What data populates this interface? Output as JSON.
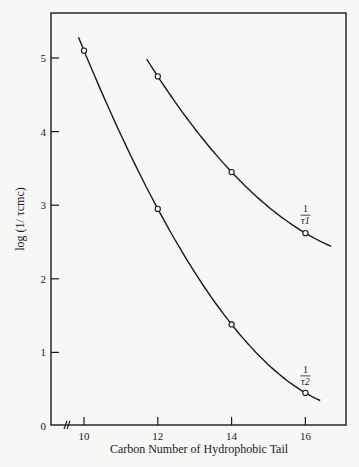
{
  "chart_data": {
    "type": "line",
    "title": "",
    "xlabel": "Carbon Number of Hydrophobic Tail",
    "ylabel": "log (1/ τcmc)",
    "x_ticks": [
      "10",
      "12",
      "14",
      "16"
    ],
    "y_ticks": [
      "0",
      "1",
      "2",
      "3",
      "4",
      "5"
    ],
    "xlim": [
      8.9,
      17
    ],
    "ylim": [
      0,
      5.6
    ],
    "grid": false,
    "axis_break_x": true,
    "series": [
      {
        "name": "1/τ1",
        "label_num": "1",
        "label_den": "τ1",
        "x": [
          12,
          14,
          16
        ],
        "values": [
          4.75,
          3.45,
          2.62
        ],
        "curve_range": [
          11.7,
          16.7
        ]
      },
      {
        "name": "1/τ2",
        "label_num": "1",
        "label_den": "τ2",
        "x": [
          10,
          12,
          14,
          16
        ],
        "values": [
          5.1,
          2.95,
          1.38,
          0.45
        ],
        "curve_range": [
          9.85,
          16.4
        ]
      }
    ]
  }
}
